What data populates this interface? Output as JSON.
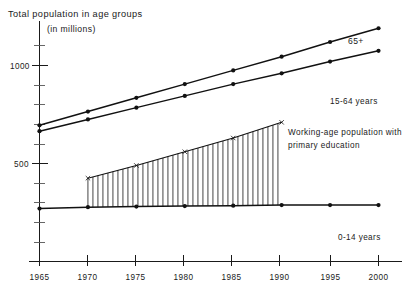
{
  "chart_data": {
    "type": "line",
    "title": "Total population in age groups",
    "subtitle": "(in millions)",
    "xlabel": "",
    "ylabel": "",
    "x": [
      1965,
      1970,
      1975,
      1980,
      1985,
      1990,
      1995,
      2000
    ],
    "xlim": [
      1963.5,
      2001.5
    ],
    "ylim": [
      0,
      1250
    ],
    "yticks_major": [
      500,
      1000
    ],
    "yticks_major_labels": [
      "500",
      "1000"
    ],
    "yticks_minor": [
      100,
      200,
      300,
      400,
      600,
      700,
      800,
      900,
      1100,
      1200
    ],
    "xtick_labels": [
      "1965",
      "1970",
      "1975",
      "1980",
      "1985",
      "1990",
      "1995",
      "2000"
    ],
    "grid": false,
    "legend_position": "inline-annotations",
    "series": [
      {
        "name": "65+",
        "label": "65+",
        "marker": "dot",
        "values": [
          695,
          765,
          835,
          905,
          975,
          1045,
          1120,
          1190
        ]
      },
      {
        "name": "15-64 years",
        "label": "15-64 years",
        "marker": "dot",
        "values": [
          665,
          725,
          785,
          845,
          905,
          960,
          1020,
          1075
        ]
      },
      {
        "name": "0-14 years",
        "label": "0-14 years",
        "marker": "dot",
        "values": [
          270,
          277,
          280,
          283,
          285,
          288,
          288,
          288
        ]
      },
      {
        "name": "Working-age population with primary education",
        "label": "Working-age population with primary education",
        "marker": "x",
        "hatched": true,
        "x": [
          1970,
          1975,
          1980,
          1985,
          1990
        ],
        "values": [
          425,
          490,
          560,
          630,
          710
        ]
      }
    ],
    "annotations": [
      {
        "text": "65+",
        "x": 2000,
        "y": 1120
      },
      {
        "text": "15-64 years",
        "x": 2000,
        "y": 905
      },
      {
        "text": "Working-age population with",
        "x": 1991,
        "y": 700
      },
      {
        "text": "primary education",
        "x": 1991,
        "y": 640
      },
      {
        "text": "0-14 years",
        "x": 1998,
        "y": 195
      }
    ]
  },
  "labels": {
    "title": "Total population in age groups",
    "subtitle": "(in millions)",
    "y_1000": "1000",
    "y_500": "500",
    "x_1965": "1965",
    "x_1970": "1970",
    "x_1975": "1975",
    "x_1980": "1980",
    "x_1985": "1985",
    "x_1990": "1990",
    "x_1995": "1995",
    "x_2000": "2000",
    "series_65plus": "65+",
    "series_15_64": "15-64 years",
    "series_0_14": "0-14 years",
    "series_workingage_line1": "Working-age population with",
    "series_workingage_line2": "primary education"
  }
}
